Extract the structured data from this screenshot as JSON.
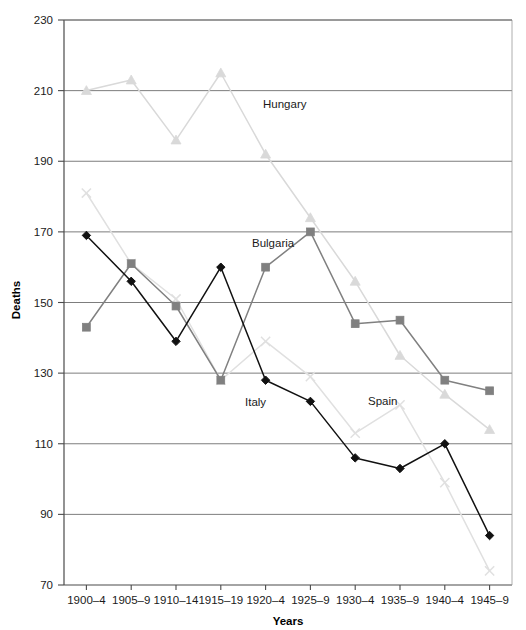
{
  "chart_data": {
    "type": "line",
    "title": "",
    "xlabel": "Years",
    "ylabel": "Deaths",
    "categories": [
      "1900–4",
      "1905–9",
      "1910–14",
      "1915–19",
      "1920–4",
      "1925–9",
      "1930–4",
      "1935–9",
      "1940–4",
      "1945–9"
    ],
    "ylim": [
      70,
      230
    ],
    "yticks": [
      70,
      90,
      110,
      130,
      150,
      170,
      190,
      210,
      230
    ],
    "grid": true,
    "legend": "inline-annotations",
    "series": [
      {
        "name": "Hungary",
        "marker": "triangle",
        "color": "#d9d9d9",
        "label_x": 263,
        "label_y": 108,
        "values": [
          210,
          213,
          196,
          215,
          192,
          174,
          156,
          135,
          124,
          114
        ]
      },
      {
        "name": "Spain",
        "marker": "cross",
        "color": "#e0e0e0",
        "label_x": 368,
        "label_y": 405,
        "values": [
          181,
          161,
          151,
          128,
          139,
          129,
          113,
          121,
          99,
          74
        ]
      },
      {
        "name": "Bulgaria",
        "marker": "square",
        "color": "#808080",
        "label_x": 252,
        "label_y": 247,
        "values": [
          143,
          161,
          149,
          128,
          160,
          170,
          144,
          145,
          128,
          125
        ]
      },
      {
        "name": "Italy",
        "marker": "diamond",
        "color": "#111111",
        "label_x": 245,
        "label_y": 406,
        "values": [
          169,
          156,
          139,
          160,
          128,
          122,
          106,
          103,
          110,
          84
        ]
      }
    ]
  },
  "axes": {
    "y_title": "Deaths",
    "x_title": "Years"
  }
}
